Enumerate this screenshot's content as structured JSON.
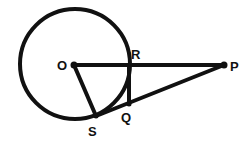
{
  "diagram": {
    "type": "geometry",
    "stroke_color": "#111111",
    "background": "#ffffff",
    "circle": {
      "center": "O",
      "cx": 75,
      "cy": 64,
      "r": 55
    },
    "points": [
      {
        "id": "O",
        "label": "O",
        "x": 74,
        "y": 65,
        "label_x": 57,
        "label_y": 70
      },
      {
        "id": "R",
        "label": "R",
        "x": 129,
        "y": 65,
        "label_x": 131,
        "label_y": 59
      },
      {
        "id": "P",
        "label": "P",
        "x": 224,
        "y": 65,
        "label_x": 230,
        "label_y": 71
      },
      {
        "id": "Q",
        "label": "Q",
        "x": 129,
        "y": 104,
        "label_x": 121,
        "label_y": 122
      },
      {
        "id": "S",
        "label": "S",
        "x": 96,
        "y": 116,
        "label_x": 88,
        "label_y": 136
      }
    ],
    "segments": [
      {
        "from": "O",
        "to": "P"
      },
      {
        "from": "O",
        "to": "S"
      },
      {
        "from": "S",
        "to": "P"
      },
      {
        "from": "R",
        "to": "Q"
      }
    ]
  }
}
